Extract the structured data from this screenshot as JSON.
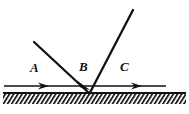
{
  "figure": {
    "width": 189,
    "height": 114,
    "background_color": "#ffffff",
    "stroke_color": "#111111"
  },
  "labels": {
    "a": "A",
    "b": "B",
    "c": "C"
  },
  "geometry": {
    "vertex": {
      "x": 89,
      "y": 93
    },
    "incident_ray": {
      "x1": 34,
      "y1": 42,
      "x2": 89,
      "y2": 93
    },
    "reflected_ray": {
      "x1": 89,
      "y1": 93,
      "x2": 133,
      "y2": 10
    },
    "horizontal_ray": {
      "x1": 4,
      "y1": 86,
      "x2": 166,
      "y2": 86
    },
    "ground_line": {
      "x1": 3,
      "y1": 93,
      "x2": 186,
      "y2": 93
    },
    "hatch_band": {
      "x": 3,
      "y": 93,
      "width": 183,
      "height": 11
    }
  },
  "arrowheads": [
    {
      "name": "arrow-on-segment-a",
      "x": 46,
      "y": 86,
      "direction": "right"
    },
    {
      "name": "arrow-near-vertex-b",
      "x": 88,
      "y": 88,
      "direction": "down-right"
    },
    {
      "name": "arrow-on-segment-c",
      "x": 140,
      "y": 86,
      "direction": "right"
    }
  ],
  "label_positions": {
    "a": {
      "x": 30,
      "y": 72
    },
    "b": {
      "x": 79,
      "y": 71
    },
    "c": {
      "x": 120,
      "y": 71
    }
  }
}
